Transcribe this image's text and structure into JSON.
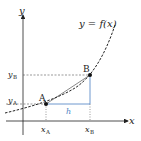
{
  "diagram": {
    "function_label": "y = f(x)",
    "axes": {
      "x_label": "x",
      "y_label": "y"
    },
    "points": [
      {
        "name": "A",
        "x_label": "x",
        "x_sub": "A",
        "y_label": "y",
        "y_sub": "A"
      },
      {
        "name": "B",
        "x_label": "x",
        "x_sub": "B",
        "y_label": "y",
        "y_sub": "B"
      }
    ],
    "step_label": "h",
    "colors": {
      "curve": "#222222",
      "axis": "#222222",
      "increment": "#4a7fc1",
      "guide": "#555555"
    }
  }
}
